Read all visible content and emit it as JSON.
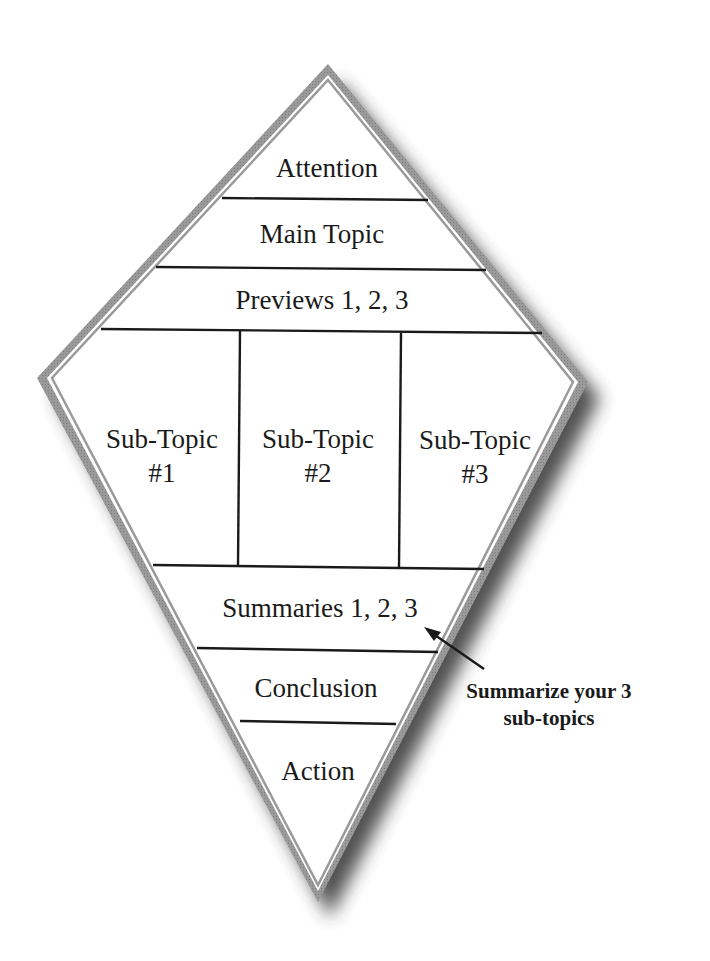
{
  "diagram": {
    "type": "kite-speech-outline",
    "colors": {
      "border": "#8f8f8f",
      "shadow": "#3a3a3a",
      "lines": "#1a1a1a",
      "background": "#ffffff"
    },
    "sections": [
      {
        "id": "attention",
        "label": "Attention"
      },
      {
        "id": "main-topic",
        "label": "Main Topic"
      },
      {
        "id": "previews",
        "label": "Previews 1, 2, 3"
      },
      {
        "id": "summaries",
        "label": "Summaries 1, 2, 3"
      },
      {
        "id": "conclusion",
        "label": "Conclusion"
      },
      {
        "id": "action",
        "label": "Action"
      }
    ],
    "subtopics": [
      {
        "line1": "Sub-Topic",
        "line2": "#1"
      },
      {
        "line1": "Sub-Topic",
        "line2": "#2"
      },
      {
        "line1": "Sub-Topic",
        "line2": "#3"
      }
    ],
    "annotation": {
      "line1": "Summarize your 3",
      "line2": "sub-topics",
      "points_to": "summaries"
    }
  }
}
